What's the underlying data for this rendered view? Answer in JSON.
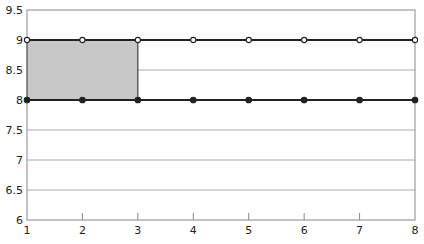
{
  "chart_data": {
    "type": "line",
    "title": "",
    "xlabel": "",
    "ylabel": "",
    "x": [
      1,
      2,
      3,
      4,
      5,
      6,
      7,
      8
    ],
    "xlim": [
      1,
      8
    ],
    "ylim": [
      6,
      9.5
    ],
    "x_ticks": [
      "1",
      "2",
      "3",
      "4",
      "5",
      "6",
      "7",
      "8"
    ],
    "y_ticks": [
      "6",
      "6.5",
      "7",
      "7.5",
      "8",
      "8.5",
      "9",
      "9.5"
    ],
    "grid": {
      "horizontal": true,
      "vertical": false
    },
    "legend": null,
    "series": [
      {
        "name": "upper",
        "values": [
          9,
          9,
          9,
          9,
          9,
          9,
          9,
          9
        ],
        "marker": "open-circle",
        "color": "#222222"
      },
      {
        "name": "lower",
        "values": [
          8,
          8,
          8,
          8,
          8,
          8,
          8,
          8
        ],
        "marker": "filled-circle",
        "color": "#222222"
      }
    ],
    "shaded_region": {
      "x": [
        1,
        3
      ],
      "y": [
        8,
        9
      ],
      "color": "#c8c8c8"
    }
  },
  "colors": {
    "axis": "#888888",
    "grid": "#aaaaaa",
    "line": "#222222",
    "fill": "#c8c8c8"
  }
}
